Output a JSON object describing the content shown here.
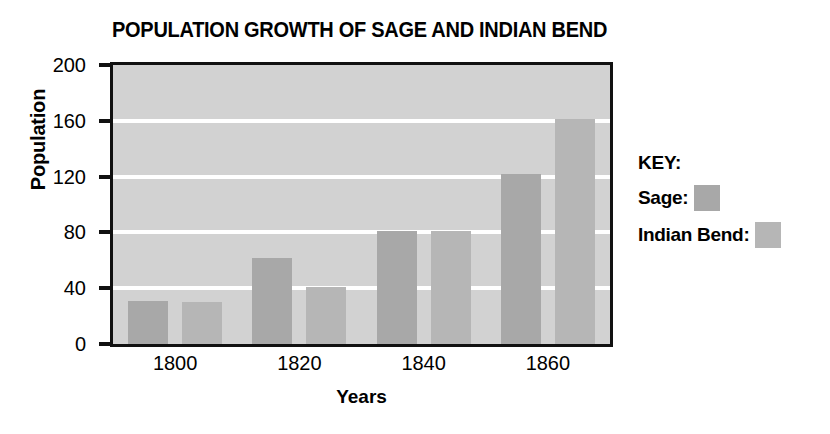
{
  "chart_data": {
    "type": "bar",
    "title": "POPULATION GROWTH OF SAGE AND INDIAN BEND",
    "xlabel": "Years",
    "ylabel": "Population",
    "categories": [
      "1800",
      "1820",
      "1840",
      "1860"
    ],
    "series": [
      {
        "name": "Sage",
        "values": [
          31,
          62,
          81,
          122
        ],
        "color": "#a8a8a8"
      },
      {
        "name": "Indian Bend",
        "values": [
          30,
          41,
          81,
          161
        ],
        "color": "#b6b6b6"
      }
    ],
    "ylim": [
      0,
      200
    ],
    "yticks": [
      0,
      40,
      80,
      120,
      160,
      200
    ],
    "ytick_labels": [
      "0",
      "40",
      "80",
      "120",
      "160",
      "200"
    ],
    "xtick_labels": [
      "1800",
      "1820",
      "1840",
      "1860"
    ],
    "grid": true,
    "gridlines_at": [
      40,
      80,
      120,
      160
    ],
    "grid_color": "#ffffff",
    "plot_background": "#d2d2d2",
    "axis_color": "#111111",
    "legend": {
      "title": "KEY:",
      "position": "right",
      "entries": [
        {
          "label": "Sage:",
          "color": "#a8a8a8"
        },
        {
          "label": "Indian Bend:",
          "color": "#b6b6b6"
        }
      ]
    }
  }
}
